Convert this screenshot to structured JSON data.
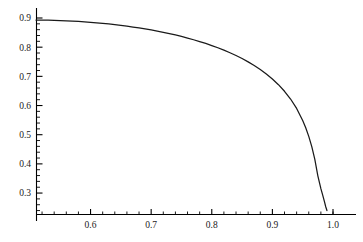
{
  "chart_data": {
    "type": "line",
    "title": "",
    "xlabel": "",
    "ylabel": "",
    "xlim": [
      0.51,
      1.005
    ],
    "ylim": [
      0.2265,
      0.9065
    ],
    "grid": false,
    "legend": null,
    "axis_color": "#000000",
    "curve_color": "#1a1a1a",
    "x_ticks_major": [
      0.6,
      0.7,
      0.8,
      0.9,
      1.0
    ],
    "x_tick_labels": [
      "0.6",
      "0.7",
      "0.8",
      "0.9",
      "1.0"
    ],
    "x_ticks_minor": [
      0.52,
      0.54,
      0.56,
      0.58,
      0.62,
      0.64,
      0.66,
      0.68,
      0.72,
      0.74,
      0.76,
      0.78,
      0.82,
      0.84,
      0.86,
      0.88,
      0.92,
      0.94,
      0.96,
      0.98,
      1.0
    ],
    "y_ticks_major": [
      0.3,
      0.4,
      0.5,
      0.6,
      0.7,
      0.8,
      0.9
    ],
    "y_tick_labels": [
      "0.3",
      "0.4",
      "0.5",
      "0.6",
      "0.7",
      "0.8",
      "0.9"
    ],
    "y_ticks_minor": [
      0.24,
      0.26,
      0.28,
      0.32,
      0.34,
      0.36,
      0.38,
      0.42,
      0.44,
      0.46,
      0.48,
      0.52,
      0.54,
      0.56,
      0.58,
      0.62,
      0.64,
      0.66,
      0.68,
      0.72,
      0.74,
      0.76,
      0.78,
      0.82,
      0.84,
      0.86,
      0.88
    ],
    "series": [
      {
        "name": "curve",
        "x": [
          0.51,
          0.52,
          0.53,
          0.54,
          0.55,
          0.56,
          0.57,
          0.58,
          0.59,
          0.6,
          0.61,
          0.62,
          0.63,
          0.64,
          0.65,
          0.66,
          0.67,
          0.68,
          0.69,
          0.7,
          0.71,
          0.72,
          0.73,
          0.74,
          0.75,
          0.76,
          0.77,
          0.78,
          0.79,
          0.8,
          0.81,
          0.82,
          0.83,
          0.84,
          0.85,
          0.86,
          0.87,
          0.88,
          0.89,
          0.9,
          0.91,
          0.92,
          0.93,
          0.94,
          0.95,
          0.955,
          0.96,
          0.965,
          0.97,
          0.975,
          0.98,
          0.983,
          0.986,
          0.988,
          0.99
        ],
        "y": [
          0.893,
          0.8928,
          0.8924,
          0.8919,
          0.8912,
          0.8903,
          0.8893,
          0.8881,
          0.8867,
          0.8852,
          0.8835,
          0.8816,
          0.8795,
          0.8772,
          0.8747,
          0.872,
          0.8691,
          0.866,
          0.8626,
          0.859,
          0.8551,
          0.851,
          0.8465,
          0.8418,
          0.8367,
          0.8313,
          0.8255,
          0.8193,
          0.8127,
          0.8056,
          0.798,
          0.7898,
          0.781,
          0.7714,
          0.7611,
          0.7497,
          0.7373,
          0.7235,
          0.7082,
          0.691,
          0.6715,
          0.6489,
          0.6223,
          0.59,
          0.549,
          0.5239,
          0.4944,
          0.459,
          0.4152,
          0.359,
          0.315,
          0.293,
          0.27,
          0.253,
          0.24
        ]
      }
    ]
  },
  "axes": {
    "x_axis_name": "horizontal-axis",
    "y_axis_name": "vertical-axis"
  }
}
